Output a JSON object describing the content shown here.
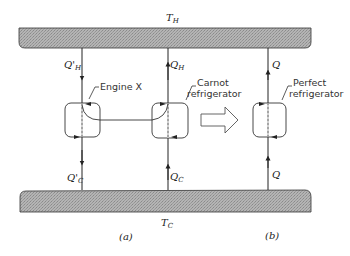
{
  "reservoirs": {
    "hot": {
      "symbol": "T",
      "subscript": "H"
    },
    "cold": {
      "symbol": "T",
      "subscript": "C"
    }
  },
  "devices": {
    "engine_x": {
      "label": "Engine X",
      "heat_in": {
        "symbol": "Q'",
        "subscript": "H"
      },
      "heat_out": {
        "symbol": "Q'",
        "subscript": "C"
      }
    },
    "carnot": {
      "label_line1": "Carnot",
      "label_line2": "refrigerator",
      "heat_top": {
        "symbol": "Q",
        "subscript": "H"
      },
      "heat_bottom": {
        "symbol": "Q",
        "subscript": "C"
      }
    },
    "perfect": {
      "label_line1": "Perfect",
      "label_line2": "refrigerator",
      "heat_top": {
        "symbol": "Q"
      },
      "heat_bottom": {
        "symbol": "Q"
      }
    }
  },
  "captions": {
    "a": "(a)",
    "b": "(b)"
  },
  "colors": {
    "reservoir_fill": "#a9a9a9",
    "stroke": "#222222"
  }
}
